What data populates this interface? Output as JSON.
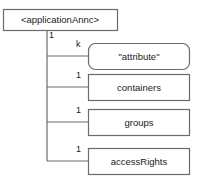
{
  "diagram": {
    "type": "tree-structure-diagram",
    "root": {
      "label": "<applicationAnnc>",
      "shape": "rectangle",
      "x": 3,
      "y": 9,
      "w": 114,
      "h": 21
    },
    "trunk": {
      "x": 47,
      "top": 30,
      "bottom": 161
    },
    "children": [
      {
        "label": "\"attribute\"",
        "multiplicity": "k",
        "shape": "rounded-rectangle",
        "x": 88,
        "y": 43,
        "w": 102,
        "h": 26,
        "branch_y": 56,
        "mult_x": 76,
        "mult_y": 40
      },
      {
        "label": "containers",
        "multiplicity": "1",
        "shape": "rectangle",
        "x": 88,
        "y": 74,
        "w": 102,
        "h": 26,
        "branch_y": 87,
        "mult_x": 76,
        "mult_y": 71
      },
      {
        "label": "groups",
        "multiplicity": "1",
        "shape": "rectangle",
        "x": 88,
        "y": 109,
        "w": 102,
        "h": 26,
        "branch_y": 122,
        "mult_x": 76,
        "mult_y": 106
      },
      {
        "label": "accessRights",
        "multiplicity": "1",
        "shape": "rectangle",
        "x": 88,
        "y": 148,
        "w": 102,
        "h": 26,
        "branch_y": 161,
        "mult_x": 76,
        "mult_y": 145
      }
    ],
    "root_multiplicity": {
      "label": "1",
      "x": 49,
      "y": 31
    },
    "colors": {
      "stroke": "#6b6b6b",
      "text": "#1a1a1a",
      "fill": "#ffffff",
      "background": "#ffffff"
    }
  }
}
